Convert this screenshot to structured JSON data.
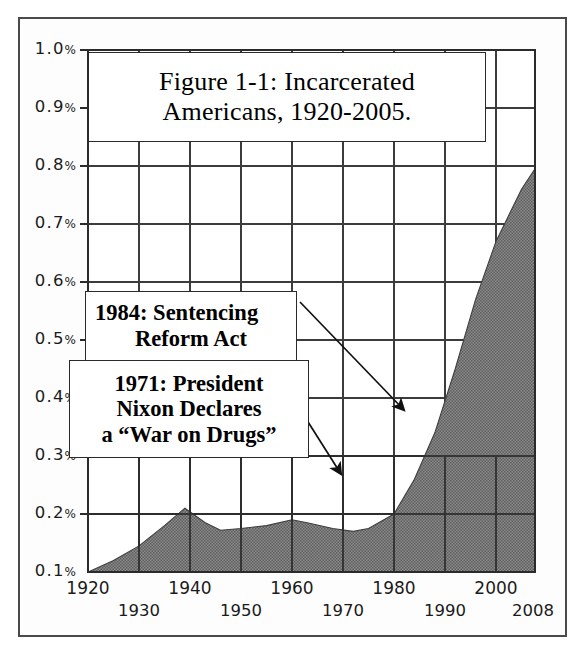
{
  "figure": {
    "title_line1": "Figure 1-1: Incarcerated",
    "title_line2": "Americans, 1920-2005."
  },
  "annotations": [
    {
      "id": "sentencing-reform-act",
      "line1": "1984: Sentencing",
      "line2": "Reform Act",
      "line3": ""
    },
    {
      "id": "war-on-drugs",
      "line1": "1971: President",
      "line2": "Nixon Declares",
      "line3": "a “War on Drugs”"
    }
  ],
  "colors": {
    "area_fill": "#7a7a7a",
    "grid": "#3c3c3c",
    "axis_text": "#1b1b1b",
    "frame": "#4a4a4a",
    "callout_border": "#2a2a2a",
    "page_background": "#ffffff"
  },
  "chart_data": {
    "type": "area",
    "title": "Figure 1-1: Incarcerated Americans, 1920-2005.",
    "xlabel": "",
    "ylabel": "",
    "xlim": [
      1920,
      2008
    ],
    "ylim": [
      0.0,
      1.0
    ],
    "grid": true,
    "legend": "none",
    "y_unit": "%",
    "yticks": [
      0.1,
      0.2,
      0.3,
      0.4,
      0.5,
      0.6,
      0.7,
      0.8,
      0.9,
      1.0
    ],
    "ytick_labels": [
      "0.1%",
      "0.2%",
      "0.3%",
      "0.4%",
      "0.5%",
      "0.6%",
      "0.7%",
      "0.8%",
      "0.9%",
      "1.0%"
    ],
    "xticks": [
      1920,
      1930,
      1940,
      1950,
      1960,
      1970,
      1980,
      1990,
      2000,
      2008
    ],
    "xtick_labels_row1": [
      "1920",
      "1940",
      "1960",
      "1980",
      "2000"
    ],
    "xtick_labels_row2": [
      "1930",
      "1950",
      "1970",
      "1990",
      "2008"
    ],
    "series": [
      {
        "name": "Incarcerated Americans (% of population)",
        "x": [
          1920,
          1925,
          1930,
          1935,
          1939,
          1943,
          1946,
          1950,
          1955,
          1960,
          1963,
          1968,
          1972,
          1975,
          1980,
          1984,
          1988,
          1992,
          1996,
          2000,
          2005,
          2008
        ],
        "values": [
          0.1,
          0.12,
          0.145,
          0.18,
          0.21,
          0.185,
          0.172,
          0.175,
          0.18,
          0.19,
          0.185,
          0.175,
          0.17,
          0.175,
          0.2,
          0.26,
          0.34,
          0.45,
          0.57,
          0.67,
          0.76,
          0.8
        ]
      }
    ],
    "annotation_markers": [
      {
        "label": "1971: President Nixon Declares a “War on Drugs”",
        "x": 1971,
        "y": 0.175
      },
      {
        "label": "1984: Sentencing Reform Act",
        "x": 1984,
        "y": 0.265
      }
    ]
  }
}
